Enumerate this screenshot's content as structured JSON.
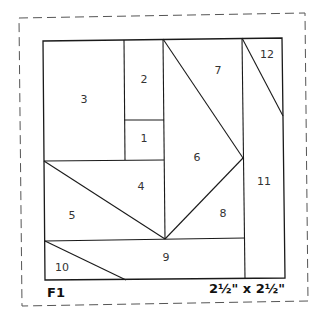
{
  "block": {
    "id": "F1",
    "size": "2½\" x 2½\""
  },
  "colors": {
    "line": "#1a1a1a",
    "dashed": "#555555",
    "text": "#333333",
    "background": "#ffffff"
  },
  "pieces": [
    {
      "number": "1",
      "x": 144,
      "y": 139
    },
    {
      "number": "2",
      "x": 144,
      "y": 80
    },
    {
      "number": "3",
      "x": 84,
      "y": 100
    },
    {
      "number": "4",
      "x": 141,
      "y": 187
    },
    {
      "number": "5",
      "x": 72,
      "y": 216
    },
    {
      "number": "6",
      "x": 197,
      "y": 158
    },
    {
      "number": "7",
      "x": 218,
      "y": 71
    },
    {
      "number": "8",
      "x": 223,
      "y": 214
    },
    {
      "number": "9",
      "x": 166,
      "y": 258
    },
    {
      "number": "10",
      "x": 62,
      "y": 268
    },
    {
      "number": "11",
      "x": 264,
      "y": 182
    },
    {
      "number": "12",
      "x": 267,
      "y": 55
    }
  ]
}
